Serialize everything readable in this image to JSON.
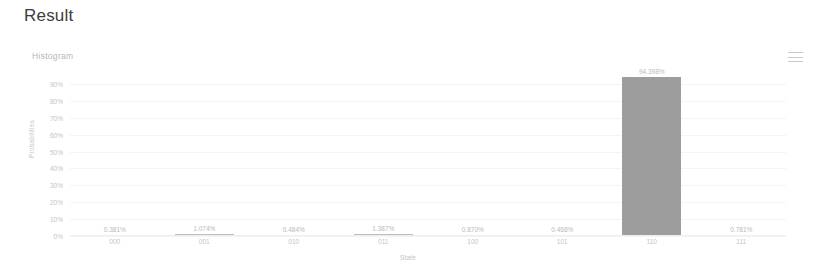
{
  "page": {
    "title": "Result"
  },
  "chart_header": {
    "title": "Histogram",
    "menu_icon": "hamburger-menu-icon",
    "menu_label": "Chart context menu"
  },
  "chart_data": {
    "type": "bar",
    "title": "Histogram",
    "subtitle": "",
    "xlabel": "State",
    "ylabel": "Probabilities",
    "categories": [
      "000",
      "001",
      "010",
      "011",
      "100",
      "101",
      "110",
      "111"
    ],
    "values": [
      0.381,
      1.074,
      0.484,
      1.387,
      0.87,
      0.468,
      94.398,
      0.781
    ],
    "value_labels": [
      "0.381%",
      "1.074%",
      "0.484%",
      "1.387%",
      "0.870%",
      "0.468%",
      "94.398%",
      "0.781%"
    ],
    "ylim": [
      0,
      90
    ],
    "ytick_values": [
      90,
      80,
      70,
      60,
      50,
      40,
      30,
      20,
      10,
      0
    ],
    "ytick_labels": [
      "90%",
      "80%",
      "70%",
      "60%",
      "50%",
      "40%",
      "30%",
      "20%",
      "10%",
      "0%"
    ],
    "grid": true,
    "legend": "none",
    "bar_color": "#9d9d9d",
    "axis_color": "#eeeeee",
    "text_color": "#c4c4c4"
  }
}
